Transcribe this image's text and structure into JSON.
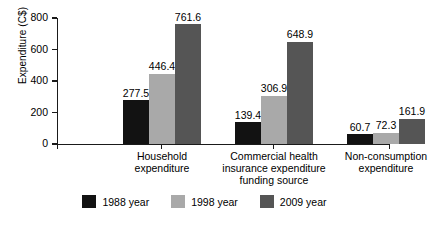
{
  "chart_data": {
    "type": "bar",
    "title": "",
    "subtitle": "",
    "xlabel": "",
    "ylabel": "Expenditure (C$)",
    "ylim": [
      0,
      800
    ],
    "yticks": [
      0,
      200,
      400,
      600,
      800
    ],
    "ytick_labels": [
      "0",
      "200",
      "400",
      "600",
      "800"
    ],
    "grid": false,
    "legend_position": "bottom",
    "grouped": true,
    "categories": [
      "Household\nexpenditure",
      "Commercial health\ninsurance expenditure\nfunding source",
      "Non-consumption\nexpenditure"
    ],
    "series": [
      {
        "name": "1988 year",
        "color": "#121212",
        "values": [
          277.5,
          139.4,
          60.7
        ],
        "labels": [
          "277.5",
          "139.4",
          "60.7"
        ]
      },
      {
        "name": "1998 year",
        "color": "#a9a9a9",
        "values": [
          446.4,
          306.9,
          72.3
        ],
        "labels": [
          "446.4",
          "306.9",
          "72.3"
        ]
      },
      {
        "name": "2009 year",
        "color": "#555555",
        "values": [
          761.6,
          648.9,
          161.9
        ],
        "labels": [
          "761.6",
          "648.9",
          "161.9"
        ]
      }
    ]
  }
}
